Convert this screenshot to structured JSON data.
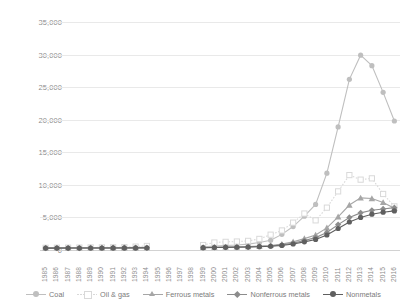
{
  "chart_data": {
    "type": "line",
    "title": "",
    "xlabel": "",
    "ylabel": "",
    "ylim": [
      0,
      35000
    ],
    "ytick_step": 5000,
    "grid": true,
    "legend_position": "bottom",
    "ytick_labels": [
      "35,000",
      "30,000",
      "25,000",
      "20,000",
      "15,000",
      "10,000",
      "5,000",
      "0"
    ],
    "ytick_values": [
      35000,
      30000,
      25000,
      20000,
      15000,
      10000,
      5000,
      0
    ],
    "categories": [
      "1985",
      "1986",
      "1987",
      "1988",
      "1989",
      "1990",
      "1991",
      "1992",
      "1993",
      "1994",
      "1995",
      "1996",
      "1997",
      "1998",
      "1999",
      "2000",
      "2001",
      "2002",
      "2003",
      "2004",
      "2005",
      "2006",
      "2007",
      "2008",
      "2009",
      "2010",
      "2011",
      "2012",
      "2013",
      "2014",
      "2015",
      "2016"
    ],
    "series": [
      {
        "name": "Coal",
        "color": "#bfbfbf",
        "marker": "circle",
        "dash": "none",
        "values": [
          320,
          330,
          340,
          350,
          360,
          370,
          380,
          390,
          400,
          420,
          null,
          null,
          null,
          null,
          500,
          620,
          700,
          760,
          900,
          1150,
          1500,
          2400,
          3600,
          5200,
          7000,
          11800,
          18900,
          26200,
          29900,
          28300,
          24200,
          19800
        ]
      },
      {
        "name": "Oil & gas",
        "color": "#d9d9d9",
        "marker": "square",
        "dash": "dotted",
        "values": [
          340,
          350,
          360,
          370,
          390,
          400,
          420,
          440,
          520,
          620,
          null,
          null,
          null,
          null,
          760,
          1150,
          1250,
          1300,
          1400,
          1700,
          2350,
          3000,
          4200,
          5600,
          4550,
          6500,
          9000,
          11500,
          10800,
          11000,
          8600,
          6700
        ]
      },
      {
        "name": "Ferrous metals",
        "color": "#a6a6a6",
        "marker": "triangle",
        "dash": "none",
        "values": [
          300,
          305,
          310,
          315,
          320,
          325,
          330,
          335,
          340,
          350,
          null,
          null,
          null,
          null,
          380,
          430,
          460,
          490,
          520,
          600,
          700,
          900,
          1250,
          1750,
          2300,
          3400,
          5100,
          6900,
          8000,
          7900,
          7300,
          6400
        ]
      },
      {
        "name": "Nonferrous metals",
        "color": "#8c8c8c",
        "marker": "diamond",
        "dash": "none",
        "values": [
          295,
          298,
          302,
          306,
          310,
          314,
          318,
          322,
          326,
          335,
          null,
          null,
          null,
          null,
          360,
          400,
          425,
          450,
          480,
          540,
          620,
          780,
          1050,
          1450,
          1900,
          2700,
          3900,
          5000,
          5700,
          6100,
          6300,
          6500
        ]
      },
      {
        "name": "Nonmetals",
        "color": "#5f5f5f",
        "marker": "circle",
        "dash": "none",
        "values": [
          290,
          293,
          296,
          300,
          304,
          308,
          312,
          316,
          320,
          328,
          null,
          null,
          null,
          null,
          350,
          385,
          405,
          425,
          455,
          505,
          575,
          700,
          920,
          1250,
          1620,
          2300,
          3300,
          4300,
          5000,
          5500,
          5800,
          6000
        ]
      }
    ]
  }
}
